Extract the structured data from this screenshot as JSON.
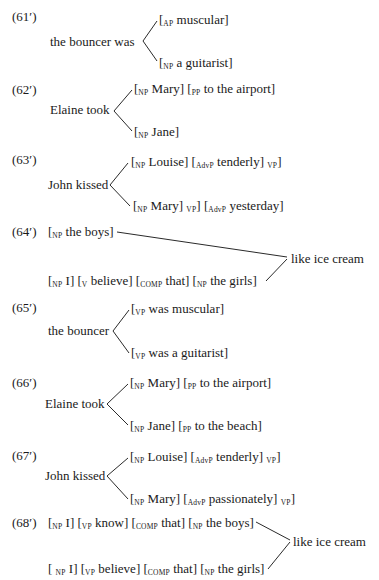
{
  "examples": [
    {
      "label": "(61′)",
      "stem": "the bouncer was",
      "branches": [
        [
          {
            "cat": "AP",
            "text": "muscular"
          }
        ],
        [
          {
            "cat": "NP",
            "text": "a guitarist"
          }
        ]
      ]
    },
    {
      "label": "(62′)",
      "stem": "Elaine took",
      "branches": [
        [
          {
            "cat": "NP",
            "text": "Mary"
          },
          {
            "cat": "PP",
            "text": "to the airport"
          }
        ],
        [
          {
            "cat": "NP",
            "text": "Jane"
          }
        ]
      ]
    },
    {
      "label": "(63′)",
      "stem": "John kissed",
      "branches": [
        [
          {
            "cat": "NP",
            "text": "Louise"
          },
          {
            "cat": "AdvP",
            "text": "tenderly",
            "close": "VP"
          }
        ],
        [
          {
            "cat": "NP",
            "text": "Mary",
            "close": "VP"
          },
          {
            "cat": "AdvP",
            "text": "yesterday"
          }
        ]
      ]
    },
    {
      "label": "(64′)",
      "joined": "like ice cream",
      "sources": [
        [
          {
            "cat": "NP",
            "text": "the boys"
          }
        ],
        [
          {
            "cat": "NP",
            "text": "I"
          },
          {
            "cat": "V",
            "text": "believe"
          },
          {
            "cat": "COMP",
            "text": "that"
          },
          {
            "cat": "NP",
            "text": "the girls"
          }
        ]
      ]
    },
    {
      "label": "(65′)",
      "stem": "the bouncer",
      "branches": [
        [
          {
            "cat": "VP",
            "text": "was muscular"
          }
        ],
        [
          {
            "cat": "VP",
            "text": "was a guitarist"
          }
        ]
      ]
    },
    {
      "label": "(66′)",
      "stem": "Elaine took",
      "branches": [
        [
          {
            "cat": "NP",
            "text": "Mary"
          },
          {
            "cat": "PP",
            "text": "to the airport"
          }
        ],
        [
          {
            "cat": "NP",
            "text": "Jane"
          },
          {
            "cat": "PP",
            "text": "to the beach"
          }
        ]
      ]
    },
    {
      "label": "(67′)",
      "stem": "John kissed",
      "branches": [
        [
          {
            "cat": "NP",
            "text": "Louise"
          },
          {
            "cat": "AdvP",
            "text": "tenderly",
            "close": "VP"
          }
        ],
        [
          {
            "cat": "NP",
            "text": "Mary"
          },
          {
            "cat": "AdvP",
            "text": "passionately",
            "close": "VP"
          }
        ]
      ]
    },
    {
      "label": "(68′)",
      "joined": "like ice cream",
      "sources": [
        [
          {
            "cat": "NP",
            "text": "I"
          },
          {
            "cat": "VP",
            "text": "know"
          },
          {
            "cat": "COMP",
            "text": "that"
          },
          {
            "cat": "NP",
            "text": "the boys"
          }
        ],
        [
          {
            "cat": "NP",
            "text": "I"
          },
          {
            "cat": "VP",
            "text": "believe"
          },
          {
            "cat": "COMP",
            "text": "that"
          },
          {
            "cat": "NP",
            "text": "the girls"
          }
        ]
      ]
    }
  ]
}
